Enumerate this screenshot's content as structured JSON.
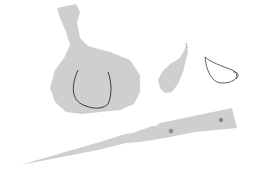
{
  "illustration": {
    "subject": "garlic-and-knife",
    "colors": {
      "background": "#ffffff",
      "fill": "#cfcfcf",
      "outline": "#3a3a3a",
      "rivet": "#8a8a8a"
    },
    "objects": [
      {
        "name": "garlic-bulb"
      },
      {
        "name": "garlic-clove"
      },
      {
        "name": "peeled-clove-outline"
      },
      {
        "name": "knife"
      }
    ]
  }
}
